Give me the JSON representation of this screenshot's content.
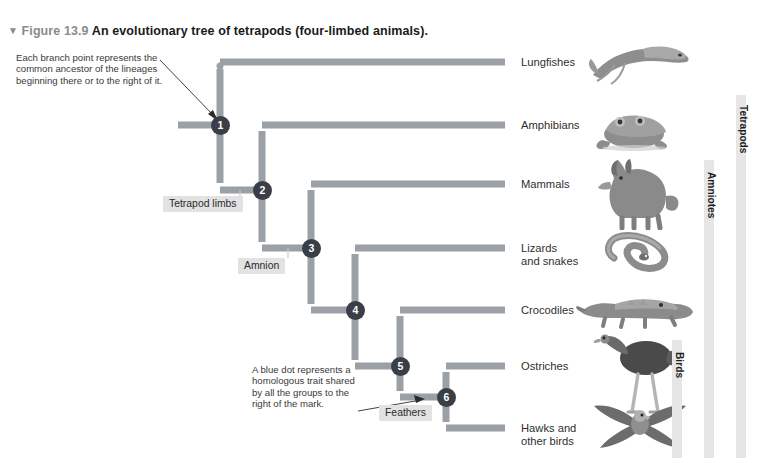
{
  "figure": {
    "triangle_glyph": "▼",
    "number_label": "Figure 13.9",
    "title": "An evolutionary tree of tetrapods (four-limbed animals)."
  },
  "notes": {
    "branch_point": "Each branch point represents the\ncommon ancestor of the lineages\nbeginning there or to the right of it.",
    "blue_dot": "A blue dot represents a\nhomologous trait shared\nby all the groups to the\nright of the mark."
  },
  "trait_marks": [
    {
      "id": "tetrapod-limbs",
      "label": "Tetrapod limbs"
    },
    {
      "id": "amnion",
      "label": "Amnion"
    },
    {
      "id": "feathers",
      "label": "Feathers"
    }
  ],
  "branch_points": [
    {
      "number": "1"
    },
    {
      "number": "2"
    },
    {
      "number": "3"
    },
    {
      "number": "4"
    },
    {
      "number": "5"
    },
    {
      "number": "6"
    }
  ],
  "taxa": [
    {
      "id": "lungfishes",
      "label": "Lungfishes",
      "icon": "lungfish-illustration"
    },
    {
      "id": "amphibians",
      "label": "Amphibians",
      "icon": "frog-illustration"
    },
    {
      "id": "mammals",
      "label": "Mammals",
      "icon": "wolf-illustration"
    },
    {
      "id": "lizards",
      "label": "Lizards\nand snakes",
      "icon": "snake-illustration"
    },
    {
      "id": "crocodiles",
      "label": "Crocodiles",
      "icon": "crocodile-illustration"
    },
    {
      "id": "ostriches",
      "label": "Ostriches",
      "icon": "ostrich-illustration"
    },
    {
      "id": "hawks",
      "label": "Hawks and\nother birds",
      "icon": "hawk-illustration"
    }
  ],
  "clades": [
    {
      "id": "birds",
      "label": "Birds"
    },
    {
      "id": "amniotes",
      "label": "Amniotes"
    },
    {
      "id": "tetrapods",
      "label": "Tetrapods"
    }
  ],
  "colors": {
    "branch": "#9aa0a6",
    "node": "#3a3f47",
    "chip_bg": "#e2e2e2",
    "clade_bar": "#e6e6e6",
    "text": "#2f2f2f",
    "caption_accent": "#8b8b8b",
    "page_bg": "#ffffff"
  }
}
